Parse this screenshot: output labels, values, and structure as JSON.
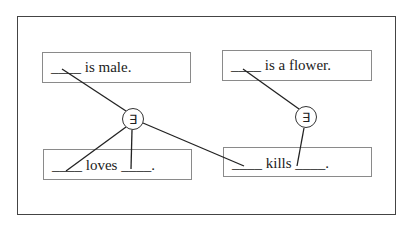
{
  "diagram": {
    "boxes": [
      {
        "id": "male",
        "text": "____ is male."
      },
      {
        "id": "flower",
        "text": "____ is a flower."
      },
      {
        "id": "loves",
        "text": "____ loves ____."
      },
      {
        "id": "kills",
        "text": "____ kills ____."
      }
    ],
    "quantifiers": [
      {
        "id": "q1",
        "symbol": "∃"
      },
      {
        "id": "q2",
        "symbol": "∃"
      }
    ],
    "colors": {
      "frame": "#444444",
      "box": "#8a8a8a",
      "line": "#222222"
    }
  }
}
